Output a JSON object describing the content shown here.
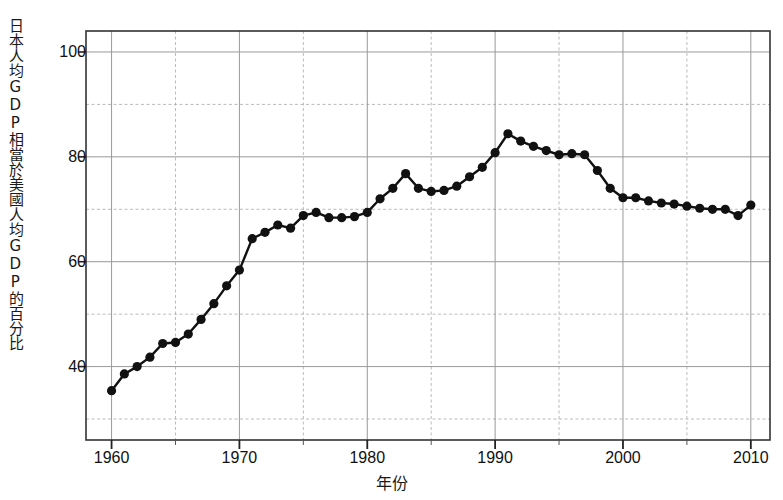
{
  "chart_data": {
    "type": "line",
    "title": "",
    "subtitle": "",
    "xlabel": "年份",
    "ylabel": "日本人均GDP相當於美國人均GDP的百分比",
    "xlim": [
      1958,
      2011.5
    ],
    "ylim": [
      26,
      104
    ],
    "grid": true,
    "legend": null,
    "x_major_ticks": [
      1960,
      1970,
      1980,
      1990,
      2000,
      2010
    ],
    "x_major_tick_labels": [
      "1960",
      "1970",
      "1980",
      "1990",
      "2000",
      "2010"
    ],
    "x_minor_ticks": [
      1965,
      1975,
      1985,
      1995,
      2005
    ],
    "y_major_ticks": [
      40,
      60,
      80,
      100
    ],
    "y_major_tick_labels": [
      "40",
      "60",
      "80",
      "100"
    ],
    "y_minor_ticks": [
      30,
      50,
      70,
      90
    ],
    "marker": "filled-circle",
    "line_color": "#111111",
    "marker_color": "#111111",
    "grid_major_color": "#999999",
    "grid_minor_color": "#aaaaaa",
    "frame_color": "#333333",
    "background_color": "#ffffff",
    "series": [
      {
        "name": "日本人均GDP佔美國人均GDP百分比",
        "x": [
          1960,
          1961,
          1962,
          1963,
          1964,
          1965,
          1966,
          1967,
          1968,
          1969,
          1970,
          1971,
          1972,
          1973,
          1974,
          1975,
          1976,
          1977,
          1978,
          1979,
          1980,
          1981,
          1982,
          1983,
          1984,
          1985,
          1986,
          1987,
          1988,
          1989,
          1990,
          1991,
          1992,
          1993,
          1994,
          1995,
          1996,
          1997,
          1998,
          1999,
          2000,
          2001,
          2002,
          2003,
          2004,
          2005,
          2006,
          2007,
          2008,
          2009,
          2010
        ],
        "values": [
          35.4,
          38.6,
          40.0,
          41.8,
          44.4,
          44.6,
          46.2,
          49.0,
          52.0,
          55.4,
          58.4,
          64.4,
          65.6,
          67.0,
          66.4,
          68.8,
          69.4,
          68.4,
          68.4,
          68.6,
          69.4,
          72.0,
          74.0,
          76.8,
          74.0,
          73.4,
          73.6,
          74.4,
          76.2,
          78.0,
          80.8,
          84.4,
          83.0,
          82.0,
          81.2,
          80.4,
          80.6,
          80.4,
          77.4,
          74.0,
          72.2,
          72.2,
          71.6,
          71.2,
          71.0,
          70.6,
          70.2,
          70.0,
          70.0,
          68.8,
          70.8
        ]
      }
    ]
  }
}
